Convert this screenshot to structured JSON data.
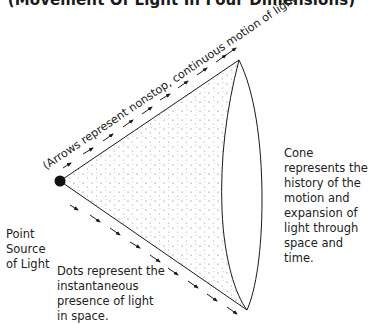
{
  "title": "(Movement Of Light In Four Dimensions)",
  "labels": {
    "arrows_caption": "(Arrows represent nonstop, continuous motion of light.)",
    "cone": "Cone represents the history of the motion and expansion of light through space and time.",
    "point_source": "Point Source of Light",
    "dots": "Dots represent the instantaneous presence of light in space."
  },
  "colors": {
    "ink": "#1a1a1a",
    "background": "#ffffff"
  }
}
